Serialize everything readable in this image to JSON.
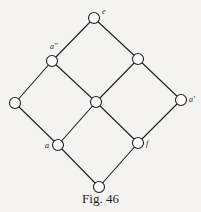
{
  "figure": {
    "caption": "Fig. 46",
    "colors": {
      "background": "#f4f3f1",
      "line": "#1e1e1e",
      "node_fill": "#ffffff"
    },
    "nodes": [
      {
        "id": "e",
        "label": "e",
        "x": 94,
        "y": 18,
        "label_dx": 8,
        "label_dy": -4
      },
      {
        "id": "a2",
        "label": "a''",
        "x": 52,
        "y": 61,
        "label_dx": -2,
        "label_dy": -12
      },
      {
        "id": "rm",
        "label": "",
        "x": 138,
        "y": 59
      },
      {
        "id": "l",
        "label": "",
        "x": 15,
        "y": 103
      },
      {
        "id": "c",
        "label": "",
        "x": 96,
        "y": 102
      },
      {
        "id": "a1",
        "label": "a'",
        "x": 181,
        "y": 100,
        "label_dx": 8,
        "label_dy": 2
      },
      {
        "id": "a",
        "label": "a",
        "x": 58,
        "y": 145,
        "label_dx": -13,
        "label_dy": 3
      },
      {
        "id": "f",
        "label": "f",
        "x": 138,
        "y": 143,
        "label_dx": 8,
        "label_dy": 3
      },
      {
        "id": "b",
        "label": "",
        "x": 99,
        "y": 187
      }
    ],
    "edges": [
      [
        "e",
        "a2"
      ],
      [
        "e",
        "rm"
      ],
      [
        "a2",
        "l"
      ],
      [
        "a2",
        "c"
      ],
      [
        "rm",
        "c"
      ],
      [
        "rm",
        "a1"
      ],
      [
        "l",
        "a"
      ],
      [
        "c",
        "a"
      ],
      [
        "c",
        "f"
      ],
      [
        "a1",
        "f"
      ],
      [
        "a",
        "b"
      ],
      [
        "f",
        "b"
      ]
    ]
  }
}
